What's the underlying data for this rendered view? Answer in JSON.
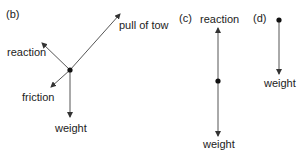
{
  "diagrams": {
    "b": {
      "label": "(b)",
      "forces": {
        "pull": "pull of tow",
        "reaction": "reaction",
        "friction": "friction",
        "weight": "weight"
      }
    },
    "c": {
      "label": "(c)",
      "forces": {
        "reaction": "reaction",
        "weight": "weight"
      }
    },
    "d": {
      "label": "(d)",
      "forces": {
        "weight": "weight"
      }
    }
  },
  "colors": {
    "line": "#555555",
    "dot": "#111111",
    "text": "#222222"
  }
}
